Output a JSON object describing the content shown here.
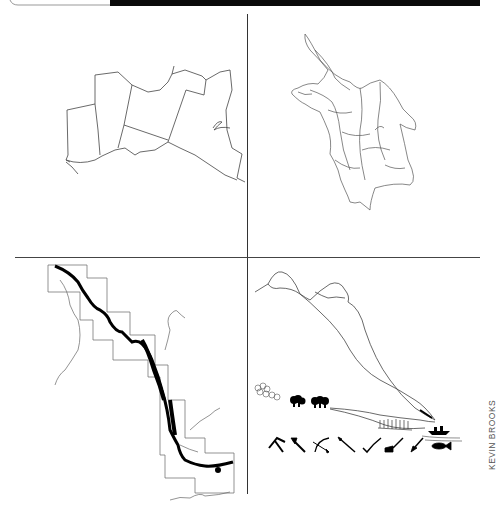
{
  "page": {
    "background": "#ffffff",
    "top_bar_color": "#0b0b0b",
    "line_color": "#333333"
  },
  "panels": [
    {
      "position": "top-left",
      "subject": "regional boundary map with shoreline"
    },
    {
      "position": "top-right",
      "subject": "watershed map with river network"
    },
    {
      "position": "bottom-left",
      "subject": "river valley map with grid of map sheets"
    },
    {
      "position": "bottom-right",
      "subject": "landscape cross-section from mountains to water with tool icons"
    }
  ],
  "icons": [
    "pickaxe-icon",
    "axe-icon",
    "bow-and-arrow-icon",
    "spear-icon",
    "sickle-icon",
    "plough-icon",
    "shovel-icon",
    "fish-icon"
  ],
  "credit": {
    "text": "KEVIN BROOKS"
  }
}
